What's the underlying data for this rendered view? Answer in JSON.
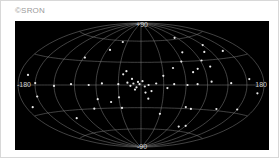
{
  "credit": "©SRON",
  "chart_data": {
    "type": "scatter",
    "projection": "aitoff-allsky",
    "title": "",
    "xlabel": "",
    "ylabel": "",
    "axis_labels": {
      "top": "+90",
      "bottom": "-90",
      "left": "-180",
      "right": "180"
    },
    "xlim": [
      -180,
      180
    ],
    "ylim": [
      -90,
      90
    ],
    "grid": true,
    "background": "#000000",
    "grid_color": "#8a8a8a",
    "point_color": "#e8e8e8",
    "points_lonlat": [
      [
        -85,
        62
      ],
      [
        -120,
        48
      ],
      [
        -142,
        38
      ],
      [
        -108,
        40
      ],
      [
        -70,
        42
      ],
      [
        -92,
        30
      ],
      [
        -60,
        30
      ],
      [
        -100,
        22
      ],
      [
        -80,
        20
      ],
      [
        -72,
        16
      ],
      [
        -45,
        22
      ],
      [
        -30,
        12
      ],
      [
        -155,
        6
      ],
      [
        -125,
        2
      ],
      [
        -96,
        4
      ],
      [
        -76,
        1
      ],
      [
        -62,
        0
      ],
      [
        -44,
        1
      ],
      [
        -20,
        2
      ],
      [
        -10,
        0
      ],
      [
        -5,
        -2
      ],
      [
        2,
        1
      ],
      [
        6,
        -3
      ],
      [
        10,
        2
      ],
      [
        14,
        -1
      ],
      [
        18,
        3
      ],
      [
        4,
        4
      ],
      [
        -2,
        5
      ],
      [
        8,
        -6
      ],
      [
        30,
        1
      ],
      [
        52,
        2
      ],
      [
        70,
        0
      ],
      [
        95,
        1
      ],
      [
        120,
        -1
      ],
      [
        150,
        2
      ],
      [
        40,
        58
      ],
      [
        55,
        46
      ],
      [
        88,
        34
      ],
      [
        20,
        18
      ],
      [
        24,
        14
      ],
      [
        165,
        10
      ],
      [
        -35,
        -4
      ],
      [
        -14,
        -8
      ],
      [
        150,
        -12
      ],
      [
        -115,
        -28
      ],
      [
        -75,
        -30
      ],
      [
        -66,
        -28
      ],
      [
        -30,
        -38
      ],
      [
        -10,
        -18
      ],
      [
        30,
        -16
      ],
      [
        42,
        -22
      ],
      [
        28,
        -30
      ],
      [
        60,
        -18
      ],
      [
        70,
        -30
      ],
      [
        -150,
        -26
      ],
      [
        -90,
        -52
      ],
      [
        -78,
        -54
      ],
      [
        110,
        -40
      ],
      [
        -170,
        -8
      ],
      [
        168,
        -22
      ],
      [
        12,
        8
      ],
      [
        -6,
        -10
      ]
    ]
  }
}
